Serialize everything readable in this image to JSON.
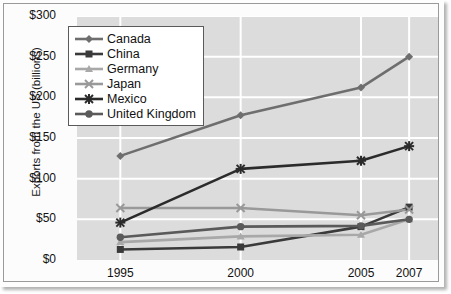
{
  "chart_data": {
    "type": "line",
    "title": "",
    "xlabel": "",
    "ylabel": "Exports from the US (billions)",
    "categories": [
      "1995",
      "2000",
      "2005",
      "2007"
    ],
    "x_positions": [
      0,
      5,
      10,
      12
    ],
    "xlim": [
      -1.8,
      13.2
    ],
    "ylim": [
      0,
      300
    ],
    "yticks": [
      0,
      50,
      100,
      150,
      200,
      250,
      300
    ],
    "ytick_labels": [
      "$0",
      "$50",
      "$100",
      "$150",
      "$200",
      "$250",
      "$300"
    ],
    "grid": true,
    "legend_position": "upper-left-inside",
    "plot_background": "#dcdcdc",
    "gridline_color": "#ffffff",
    "series": [
      {
        "name": "Canada",
        "values": [
          128,
          178,
          212,
          250
        ],
        "color": "#6e6e6e",
        "marker": "diamond"
      },
      {
        "name": "China",
        "values": [
          13,
          16,
          41,
          65
        ],
        "color": "#3a3a3a",
        "marker": "square"
      },
      {
        "name": "Germany",
        "values": [
          22,
          29,
          31,
          50
        ],
        "color": "#a8a8a8",
        "marker": "triangle"
      },
      {
        "name": "Japan",
        "values": [
          64,
          64,
          55,
          62
        ],
        "color": "#999999",
        "marker": "x"
      },
      {
        "name": "Mexico",
        "values": [
          46,
          112,
          122,
          140
        ],
        "color": "#2b2b2b",
        "marker": "asterisk"
      },
      {
        "name": "United Kingdom",
        "values": [
          28,
          41,
          42,
          50
        ],
        "color": "#5a5a5a",
        "marker": "circle"
      }
    ]
  },
  "axis": {
    "y_title": "Exports from the US (billions)"
  },
  "legend": {
    "entries": [
      {
        "label": "Canada"
      },
      {
        "label": "China"
      },
      {
        "label": "Germany"
      },
      {
        "label": "Japan"
      },
      {
        "label": "Mexico"
      },
      {
        "label": "United Kingdom"
      }
    ]
  }
}
